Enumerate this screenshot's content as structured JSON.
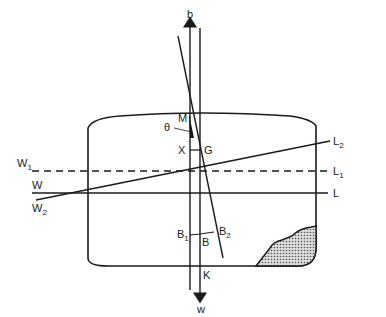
{
  "diagram": {
    "type": "ship stability diagram",
    "labels": {
      "b": "b",
      "w": "w",
      "M": "M",
      "theta": "θ",
      "X": "X",
      "G": "G",
      "B": "B",
      "K": "K",
      "B1": {
        "main": "B",
        "sub": "1"
      },
      "B2": {
        "main": "B",
        "sub": "2"
      },
      "W": "W",
      "W1": {
        "main": "W",
        "sub": "1"
      },
      "W2": {
        "main": "W",
        "sub": "2"
      },
      "L": "L",
      "L1": {
        "main": "L",
        "sub": "1"
      },
      "L2": {
        "main": "L",
        "sub": "2"
      }
    },
    "colors": {
      "line": "#1a1a1a",
      "fill_pattern": "#888888"
    }
  }
}
